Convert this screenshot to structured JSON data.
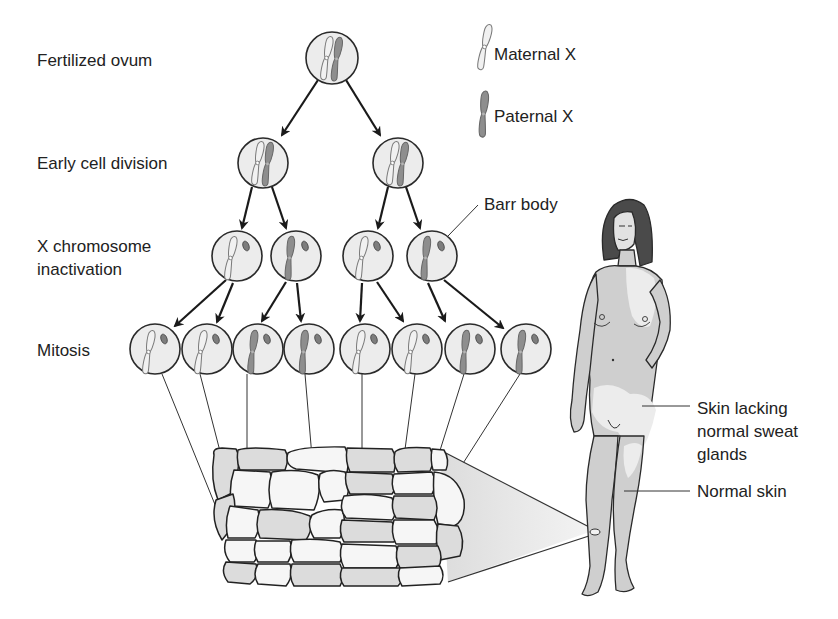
{
  "figure": {
    "stage_labels": [
      {
        "id": "fertilized",
        "text": "Fertilized ovum"
      },
      {
        "id": "early",
        "text": "Early cell division"
      },
      {
        "id": "inactivation_1",
        "text": "X chromosome"
      },
      {
        "id": "inactivation_2",
        "text": "inactivation"
      },
      {
        "id": "mitosis",
        "text": "Mitosis"
      }
    ],
    "legend": {
      "maternal": "Maternal X",
      "paternal": "Paternal X"
    },
    "callouts": {
      "barr_body": "Barr body",
      "skin_lacking_1": "Skin lacking",
      "skin_lacking_2": "normal sweat",
      "skin_lacking_3": "glands",
      "normal_skin": "Normal skin"
    },
    "colors": {
      "maternal_chromosome": "#e6e6e6",
      "paternal_chromosome": "#8e8e8e",
      "cell_fill": "#ececec",
      "outline": "#2a2a2a",
      "hair": "#4a4a4a",
      "skin_normal": "#cfcfcf",
      "skin_lacking": "#e8e8e8"
    },
    "tree": {
      "fertilized_ovum": {
        "chromosomes": [
          "maternal",
          "paternal"
        ]
      },
      "early_division": [
        {
          "chromosomes": [
            "maternal",
            "paternal"
          ]
        },
        {
          "chromosomes": [
            "maternal",
            "paternal"
          ]
        }
      ],
      "inactivation": [
        {
          "active": "maternal",
          "barr_body": true
        },
        {
          "active": "paternal",
          "barr_body": true
        },
        {
          "active": "maternal",
          "barr_body": true
        },
        {
          "active": "paternal",
          "barr_body": true
        }
      ],
      "mitosis": [
        {
          "active": "maternal"
        },
        {
          "active": "maternal"
        },
        {
          "active": "paternal"
        },
        {
          "active": "paternal"
        },
        {
          "active": "maternal"
        },
        {
          "active": "maternal"
        },
        {
          "active": "paternal"
        },
        {
          "active": "paternal"
        }
      ]
    }
  }
}
